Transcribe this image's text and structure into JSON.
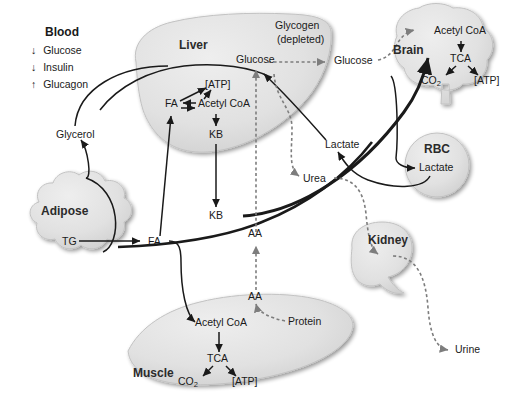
{
  "figure": {
    "background": "#ffffff",
    "organ_fill": "#e2e2e2",
    "organ_stroke": "#bdbdbd",
    "line_color": "#1a1a1a",
    "dotted_color": "#8a8a8a",
    "text_color": "#1a1a1a"
  },
  "legend": {
    "title": "Blood",
    "items": [
      {
        "arrow": "down-arrow-icon",
        "arrow_glyph": "↓",
        "label": "Glucose"
      },
      {
        "arrow": "down-arrow-icon",
        "arrow_glyph": "↓",
        "label": "Insulin"
      },
      {
        "arrow": "up-arrow-icon",
        "arrow_glyph": "↑",
        "label": "Glucagon"
      }
    ]
  },
  "organs": {
    "liver": {
      "name": "Liver"
    },
    "brain": {
      "name": "Brain"
    },
    "rbc": {
      "name": "RBC"
    },
    "kidney": {
      "name": "Kidney"
    },
    "adipose": {
      "name": "Adipose"
    },
    "muscle": {
      "name": "Muscle"
    }
  },
  "labels": {
    "glycogen_depleted_line1": "Glycogen",
    "glycogen_depleted_line2": "(depleted)",
    "liver_glucose": "Glucose",
    "blood_glucose": "Glucose",
    "liver_atp": "[ATP]",
    "liver_fa": "FA",
    "liver_acetyl_coa": "Acetyl CoA",
    "liver_kb": "KB",
    "blood_kb": "KB",
    "glycerol": "Glycerol",
    "adipose_tg": "TG",
    "blood_fa": "FA",
    "blood_lactate": "Lactate",
    "rbc_lactate": "Lactate",
    "urea": "Urea",
    "urine": "Urine",
    "blood_aa": "AA",
    "muscle_aa": "AA",
    "protein": "Protein",
    "muscle_acetyl_coa": "Acetyl CoA",
    "muscle_tca": "TCA",
    "muscle_co2": "CO",
    "muscle_co2_sub": "2",
    "muscle_atp": "[ATP]",
    "brain_acetyl_coa": "Acetyl CoA",
    "brain_tca": "TCA",
    "brain_co2": "CO",
    "brain_co2_sub": "2",
    "brain_atp": "[ATP]"
  }
}
